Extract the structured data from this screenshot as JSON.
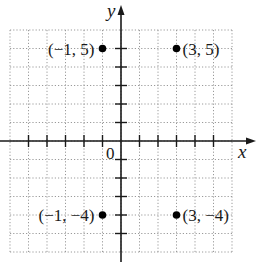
{
  "chart_data": {
    "type": "scatter",
    "title": "",
    "xlabel": "x",
    "ylabel": "y",
    "origin_label": "0",
    "xlim": [
      -6,
      6
    ],
    "ylim": [
      -6,
      6
    ],
    "grid": true,
    "grid_style": "dotted",
    "points": [
      {
        "x": -1,
        "y": 5,
        "label": "(−1, 5)",
        "label_side": "left"
      },
      {
        "x": 3,
        "y": 5,
        "label": "(3, 5)",
        "label_side": "right"
      },
      {
        "x": -1,
        "y": -4,
        "label": "(−1, −4)",
        "label_side": "left"
      },
      {
        "x": 3,
        "y": -4,
        "label": "(3, −4)",
        "label_side": "right"
      }
    ],
    "x_ticks": [
      -5,
      -4,
      -3,
      -2,
      -1,
      1,
      2,
      3,
      4,
      5
    ],
    "y_ticks": [
      -5,
      -4,
      -3,
      -2,
      -1,
      1,
      2,
      3,
      4,
      5
    ],
    "colors": {
      "axis": "#1a1a1a",
      "grid": "#9a9a9a",
      "point": "#000000"
    }
  }
}
